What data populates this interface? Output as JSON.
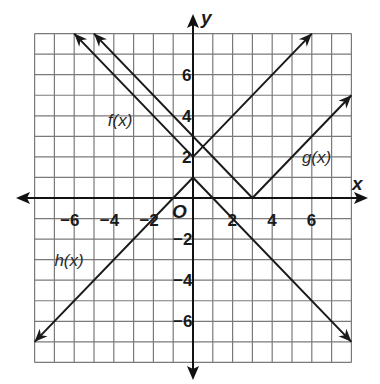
{
  "chart_data": {
    "type": "line",
    "title": "",
    "xlabel": "x",
    "ylabel": "y",
    "origin_label": "O",
    "xlim": [
      -8,
      8
    ],
    "ylim": [
      -8,
      8
    ],
    "grid": true,
    "x_ticks": [
      -6,
      -4,
      -2,
      2,
      4,
      6
    ],
    "y_ticks": [
      -6,
      -4,
      -2,
      2,
      4,
      6
    ],
    "x_tick_labels": [
      "−6",
      "−4",
      "−2",
      "2",
      "4",
      "6"
    ],
    "y_tick_labels": [
      "−6",
      "−4",
      "−2",
      "2",
      "4",
      "6"
    ],
    "series": [
      {
        "name": "f(x)",
        "equation": "f(x) = |x| + 2",
        "points": [
          [
            -6,
            8
          ],
          [
            0,
            2
          ],
          [
            6,
            8
          ]
        ],
        "label_pos": [
          -4.3,
          3.5
        ]
      },
      {
        "name": "g(x)",
        "equation": "g(x) = |x - 3|",
        "points": [
          [
            -5,
            8
          ],
          [
            3,
            0
          ],
          [
            8,
            5
          ]
        ],
        "label_pos": [
          5.5,
          1.7
        ]
      },
      {
        "name": "h(x)",
        "equation": "h(x) = -|x| + 1",
        "points": [
          [
            -8,
            -7
          ],
          [
            0,
            1
          ],
          [
            8,
            -7
          ]
        ],
        "label_pos": [
          -7.0,
          -3.3
        ]
      }
    ],
    "legend": "none (inline labels)"
  }
}
